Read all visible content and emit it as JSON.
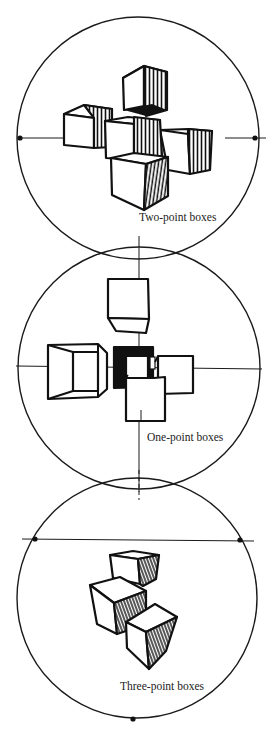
{
  "figure": {
    "panels": [
      {
        "id": "two-point",
        "label": "Two-point boxes",
        "vanishing_points": 2
      },
      {
        "id": "one-point",
        "label": "One-point boxes",
        "vanishing_points": 1
      },
      {
        "id": "three-point",
        "label": "Three-point boxes",
        "vanishing_points": 3
      }
    ]
  },
  "colors": {
    "ink": "#111111",
    "paper": "#ffffff"
  }
}
